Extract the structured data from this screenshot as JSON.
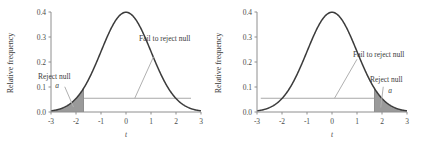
{
  "figure": {
    "panel_count": 2,
    "colors": {
      "curve": "#3b3b3b",
      "shaded_region": "#9a9a9a",
      "axis": "#8e8e8e",
      "leader_line": "#b0b0b0",
      "background": "#ffffff"
    }
  },
  "chart_data": [
    {
      "type": "area",
      "title": "",
      "subtitle": "",
      "xlabel": "t",
      "ylabel": "Relative frequency",
      "xlim": [
        -3,
        3
      ],
      "ylim": [
        0.0,
        0.4
      ],
      "xticks": [
        -3,
        -2,
        -1,
        0,
        1,
        2,
        3
      ],
      "xticklabels": [
        "-3",
        "-2",
        "-1",
        "0",
        "1",
        "2",
        "3"
      ],
      "yticks": [
        0.0,
        0.1,
        0.2,
        0.3,
        0.4
      ],
      "yticklabels": [
        "0.0",
        "0.1",
        "0.2",
        "0.3",
        "0.4"
      ],
      "grid": false,
      "legend": null,
      "distribution": "standard normal (t distribution)",
      "peak_value": 0.4,
      "peak_x": 0,
      "tail": "left",
      "critical_value": -1.7,
      "alpha_level_line_y": 0.055,
      "alpha_line_x_start": -1.7,
      "alpha_line_x_end": 2.6,
      "shaded_region_label": "Reject null",
      "shaded_region_symbol": "a",
      "unshaded_region_label": "Fail to reject null",
      "series": [
        {
          "name": "t distribution density",
          "x": [
            -3.0,
            -2.75,
            -2.5,
            -2.25,
            -2.0,
            -1.75,
            -1.5,
            -1.25,
            -1.0,
            -0.75,
            -0.5,
            -0.25,
            0.0,
            0.25,
            0.5,
            0.75,
            1.0,
            1.25,
            1.5,
            1.75,
            2.0,
            2.25,
            2.5,
            2.75,
            3.0
          ],
          "values": [
            0.004,
            0.009,
            0.018,
            0.032,
            0.054,
            0.086,
            0.13,
            0.183,
            0.242,
            0.301,
            0.352,
            0.387,
            0.399,
            0.387,
            0.352,
            0.301,
            0.242,
            0.183,
            0.13,
            0.086,
            0.054,
            0.032,
            0.018,
            0.009,
            0.004
          ]
        }
      ],
      "annotations": [
        {
          "text": "Reject null",
          "symbol": "a",
          "points_to_x": -2.1,
          "points_to_y": 0.02,
          "label_x": -2.45,
          "label_y": 0.105
        },
        {
          "text": "Fail to reject null",
          "points_to_x": 0.35,
          "points_to_y": 0.055,
          "label_x": 1.1,
          "label_y": 0.225
        }
      ]
    },
    {
      "type": "area",
      "title": "",
      "subtitle": "",
      "xlabel": "t",
      "ylabel": "Relative frequency",
      "xlim": [
        -3,
        3
      ],
      "ylim": [
        0.0,
        0.4
      ],
      "xticks": [
        -3,
        -2,
        -1,
        0,
        1,
        2,
        3
      ],
      "xticklabels": [
        "-3",
        "-2",
        "-1",
        "0",
        "1",
        "2",
        "3"
      ],
      "yticks": [
        0.0,
        0.1,
        0.2,
        0.3,
        0.4
      ],
      "yticklabels": [
        "0.0",
        "0.1",
        "0.2",
        "0.3",
        "0.4"
      ],
      "grid": false,
      "legend": null,
      "distribution": "standard normal (t distribution)",
      "peak_value": 0.4,
      "peak_x": 0,
      "tail": "right",
      "critical_value": 1.7,
      "alpha_level_line_y": 0.055,
      "alpha_line_x_start": -2.85,
      "alpha_line_x_end": 1.7,
      "shaded_region_label": "Reject null",
      "shaded_region_symbol": "a",
      "unshaded_region_label": "Fail to reject null",
      "series": [
        {
          "name": "t distribution density",
          "x": [
            -3.0,
            -2.75,
            -2.5,
            -2.25,
            -2.0,
            -1.75,
            -1.5,
            -1.25,
            -1.0,
            -0.75,
            -0.5,
            -0.25,
            0.0,
            0.25,
            0.5,
            0.75,
            1.0,
            1.25,
            1.5,
            1.75,
            2.0,
            2.25,
            2.5,
            2.75,
            3.0
          ],
          "values": [
            0.004,
            0.009,
            0.018,
            0.032,
            0.054,
            0.086,
            0.13,
            0.183,
            0.242,
            0.301,
            0.352,
            0.387,
            0.399,
            0.387,
            0.352,
            0.301,
            0.242,
            0.183,
            0.13,
            0.086,
            0.054,
            0.032,
            0.018,
            0.009,
            0.004
          ]
        }
      ],
      "annotations": [
        {
          "text": "Fail to reject null",
          "points_to_x": 0.1,
          "points_to_y": 0.055,
          "label_x": 1.0,
          "label_y": 0.215
        },
        {
          "text": "Reject null",
          "symbol": "a",
          "points_to_x": 1.95,
          "points_to_y": 0.018,
          "label_x": 2.05,
          "label_y": 0.105
        }
      ]
    }
  ],
  "labels": {
    "left": {
      "ylabel": "Relative frequency",
      "xlabel": "t",
      "reject": "Reject null",
      "alpha": "a",
      "fail": "Fail to reject null",
      "xtick_0": "-3",
      "xtick_1": "-2",
      "xtick_2": "-1",
      "xtick_3": "0",
      "xtick_4": "1",
      "xtick_5": "2",
      "xtick_6": "3",
      "ytick_0": "0.0",
      "ytick_1": "0.1",
      "ytick_2": "0.2",
      "ytick_3": "0.3",
      "ytick_4": "0.4"
    },
    "right": {
      "ylabel": "Relative frequency",
      "xlabel": "t",
      "reject": "Reject null",
      "alpha": "a",
      "fail": "Fail to reject null",
      "xtick_0": "-3",
      "xtick_1": "-2",
      "xtick_2": "-1",
      "xtick_3": "0",
      "xtick_4": "1",
      "xtick_5": "2",
      "xtick_6": "3",
      "ytick_0": "0.0",
      "ytick_1": "0.1",
      "ytick_2": "0.2",
      "ytick_3": "0.3",
      "ytick_4": "0.4"
    }
  }
}
